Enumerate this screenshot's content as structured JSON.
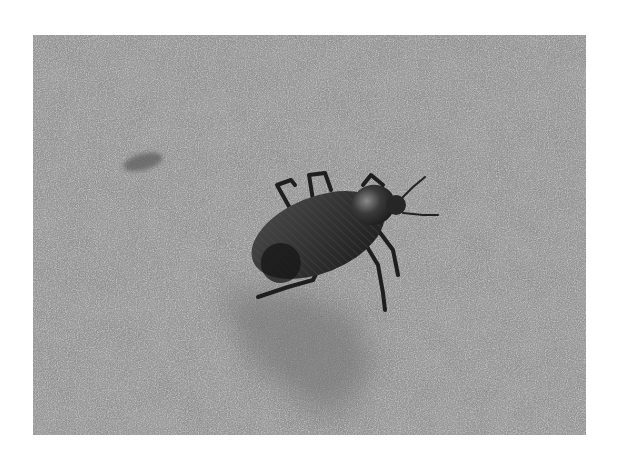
{
  "image": {
    "subject": "beetle",
    "background": "asphalt-pavement",
    "colorspace": "grayscale",
    "photo_bounds": {
      "x": 33,
      "y": 35,
      "width": 553,
      "height": 400
    },
    "colors": {
      "page_background": "#ffffff",
      "pavement": "#9a9a9a",
      "beetle_body": "#2a2a2a",
      "shadow": "#7a7a7a"
    }
  }
}
